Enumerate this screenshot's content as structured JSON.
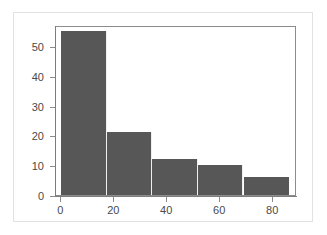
{
  "chart_data": {
    "type": "bar",
    "title": "",
    "subtitle": "",
    "xlabel": "",
    "ylabel": "",
    "bin_edges": [
      0,
      17.2,
      34.4,
      51.6,
      68.8,
      86
    ],
    "categories": [
      "0-17",
      "17-34",
      "34-52",
      "52-69",
      "69-86"
    ],
    "values": [
      55,
      21,
      12,
      10,
      6
    ],
    "xlim": [
      -2,
      89
    ],
    "ylim": [
      0,
      57
    ],
    "xticks": [
      0,
      20,
      40,
      60,
      80
    ],
    "xtick_labels": [
      "0",
      "20",
      "40",
      "60",
      "80"
    ],
    "yticks": [
      0,
      10,
      20,
      30,
      40,
      50
    ],
    "ytick_labels": [
      "0",
      "10",
      "20",
      "30",
      "40",
      "50"
    ],
    "grid": false,
    "legend": null,
    "bar_color": "#575757",
    "axis_color": "#8c8c8c",
    "background_color": "#ffffff",
    "frame_color": "#e2e2e2"
  }
}
